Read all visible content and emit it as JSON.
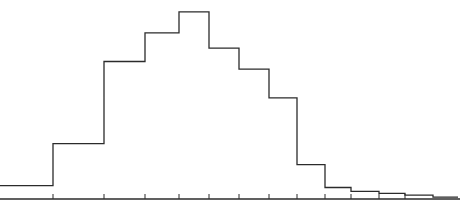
{
  "chart_data": {
    "type": "bar",
    "subtype": "step-histogram",
    "title": "",
    "xlabel": "",
    "ylabel": "",
    "grid": false,
    "legend": null,
    "categories": [
      "1",
      "2",
      "3",
      "4",
      "5",
      "6",
      "7",
      "8",
      "9",
      "10",
      "11",
      "12",
      "13",
      "14"
    ],
    "bin_edges_px": [
      0,
      53,
      104,
      145,
      179,
      209,
      239,
      269,
      297,
      325,
      351,
      379,
      405,
      433,
      458
    ],
    "values": [
      7,
      29,
      72,
      87,
      98,
      79,
      68,
      53,
      18,
      6,
      4,
      3,
      2,
      1
    ],
    "ylim": [
      0,
      100
    ],
    "colors": {
      "line": "#2b2b2b",
      "axis": "#2b2b2b",
      "background": "#ffffff"
    }
  }
}
